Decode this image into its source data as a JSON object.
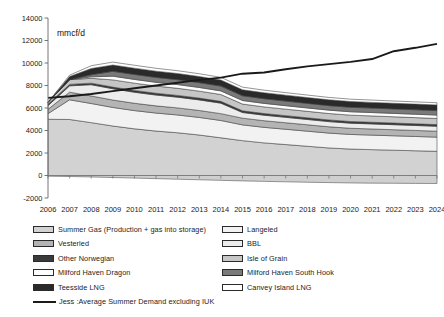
{
  "chart_data": {
    "type": "area",
    "title": "",
    "xlabel": "",
    "ylabel": "mmcf/d",
    "ylim": [
      -2000,
      14000
    ],
    "ytick_step": 2000,
    "yticks": [
      "14000",
      "12000",
      "10000",
      "8000",
      "6000",
      "4000",
      "2000",
      "0",
      "-2000"
    ],
    "grid": false,
    "legend_position": "bottom",
    "stacked": true,
    "categories": [
      "2006",
      "2007",
      "2008",
      "2009",
      "2010",
      "2011",
      "2012",
      "2013",
      "2014",
      "2015",
      "2016",
      "2017",
      "2018",
      "2019",
      "2020",
      "2021",
      "2022",
      "2023",
      "2024"
    ],
    "series": [
      {
        "name": "Summer Gas (Production + gas into storage)",
        "color": "#d2d2d2",
        "values": [
          5000,
          4980,
          4700,
          4400,
          4150,
          3950,
          3800,
          3600,
          3350,
          3100,
          2900,
          2750,
          2600,
          2450,
          2350,
          2300,
          2250,
          2200,
          2150
        ]
      },
      {
        "name": "Langeled",
        "color": "#f2f2f2",
        "values": [
          500,
          1750,
          1700,
          1650,
          1620,
          1600,
          1580,
          1560,
          1540,
          1400,
          1380,
          1360,
          1340,
          1320,
          1300,
          1290,
          1280,
          1270,
          1260
        ]
      },
      {
        "name": "Vesterled",
        "color": "#b4b4b4",
        "values": [
          380,
          680,
          670,
          660,
          650,
          640,
          630,
          620,
          610,
          600,
          590,
          580,
          570,
          560,
          550,
          545,
          540,
          535,
          530
        ]
      },
      {
        "name": "BBL",
        "color": "#ececec",
        "values": [
          330,
          560,
          1000,
          1000,
          980,
          960,
          950,
          940,
          930,
          500,
          490,
          480,
          470,
          460,
          450,
          450,
          445,
          440,
          435
        ]
      },
      {
        "name": "Other Norwegian",
        "color": "#3a3a3a",
        "values": [
          120,
          130,
          140,
          150,
          160,
          160,
          160,
          160,
          160,
          150,
          150,
          150,
          150,
          150,
          150,
          150,
          150,
          150,
          150
        ]
      },
      {
        "name": "Isle of Grain",
        "color": "#c6c6c6",
        "values": [
          180,
          420,
          430,
          640,
          650,
          640,
          630,
          620,
          610,
          600,
          590,
          580,
          575,
          570,
          565,
          560,
          555,
          550,
          545
        ]
      },
      {
        "name": "Milford Haven Dragon",
        "color": "#fdfdfd",
        "values": [
          0,
          0,
          130,
          330,
          330,
          330,
          330,
          325,
          320,
          315,
          310,
          305,
          300,
          300,
          300,
          300,
          300,
          300,
          300
        ]
      },
      {
        "name": "Milford Haven South Hook",
        "color": "#7a7a7a",
        "values": [
          0,
          0,
          180,
          430,
          440,
          440,
          435,
          430,
          425,
          420,
          415,
          410,
          405,
          400,
          400,
          400,
          400,
          400,
          400
        ]
      },
      {
        "name": "Teesside LNG",
        "color": "#2a2a2a",
        "values": [
          0,
          280,
          560,
          560,
          560,
          555,
          550,
          545,
          540,
          535,
          530,
          525,
          520,
          515,
          510,
          505,
          500,
          500,
          500
        ]
      },
      {
        "name": "Canvey Island LNG",
        "color": "#ffffff",
        "values": [
          0,
          120,
          250,
          260,
          260,
          255,
          250,
          245,
          240,
          235,
          230,
          225,
          220,
          215,
          210,
          205,
          200,
          200,
          200
        ]
      }
    ],
    "negative_band": {
      "name": "net-outflow",
      "color": "#cfcfcf",
      "values": [
        -60,
        -90,
        -130,
        -180,
        -230,
        -280,
        -330,
        -380,
        -430,
        -480,
        -520,
        -560,
        -600,
        -630,
        -660,
        -680,
        -690,
        -700,
        -710
      ]
    },
    "line_series": {
      "name": "Jess :Average Summer Demand excluding IUK",
      "color": "#1a1a1a",
      "values": [
        6900,
        7050,
        7250,
        7500,
        7750,
        8000,
        8250,
        8500,
        8700,
        9050,
        9150,
        9450,
        9700,
        9900,
        10100,
        10350,
        11050,
        11350,
        11700
      ]
    }
  },
  "legend": {
    "left_items": [
      {
        "label": "Summer Gas (Production + gas into storage)",
        "swatch": "#d2d2d2",
        "type": "box"
      },
      {
        "label": "Vesterled",
        "swatch": "#b4b4b4",
        "type": "box"
      },
      {
        "label": "Other Norwegian",
        "swatch": "#3a3a3a",
        "type": "box"
      },
      {
        "label": "Milford Haven Dragon",
        "swatch": "#fdfdfd",
        "type": "box"
      },
      {
        "label": "Teesside LNG",
        "swatch": "#2a2a2a",
        "type": "box"
      },
      {
        "label": "Jess :Average Summer Demand excluding IUK",
        "swatch": "#1a1a1a",
        "type": "line"
      }
    ],
    "right_items": [
      {
        "label": "Langeled",
        "swatch": "#f2f2f2",
        "type": "box"
      },
      {
        "label": "BBL",
        "swatch": "#ececec",
        "type": "box"
      },
      {
        "label": "Isle of Grain",
        "swatch": "#c6c6c6",
        "type": "box"
      },
      {
        "label": "Milford Haven South Hook",
        "swatch": "#7a7a7a",
        "type": "box"
      },
      {
        "label": "Canvey Island LNG",
        "swatch": "#ffffff",
        "type": "box"
      }
    ]
  }
}
